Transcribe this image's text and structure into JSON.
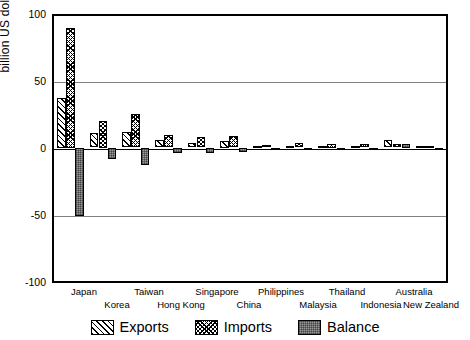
{
  "chart_data": {
    "type": "bar",
    "title": "",
    "subtitle": "",
    "xlabel": "",
    "ylabel": "billion US dollars",
    "ylim": [
      -100,
      100
    ],
    "yticks": [
      100,
      50,
      0,
      -50,
      -100
    ],
    "ytick_labels": [
      "100",
      "50",
      "0",
      "-50",
      "-100"
    ],
    "grid": true,
    "grid_axis": "y",
    "legend_position": "bottom-center",
    "categories": [
      "Japan",
      "Korea",
      "Taiwan",
      "Hong Kong",
      "Singapore",
      "China",
      "Philippines",
      "Malaysia",
      "Thailand",
      "Indonesia",
      "Australia",
      "New Zealand"
    ],
    "series": [
      {
        "name": "Exports",
        "pattern": "diagonal-hatch",
        "values": [
          37.5,
          11.0,
          12.0,
          5.5,
          3.5,
          5.0,
          1.5,
          1.5,
          1.5,
          1.5,
          6.0,
          1.0
        ]
      },
      {
        "name": "Imports",
        "pattern": "cross-hatch",
        "values": [
          90.0,
          20.0,
          25.5,
          9.5,
          8.0,
          9.0,
          2.0,
          3.5,
          2.5,
          3.0,
          3.0,
          1.0
        ]
      },
      {
        "name": "Balance",
        "pattern": "solid-gray",
        "values": [
          -52.0,
          -9.0,
          -13.5,
          -4.5,
          -4.0,
          -3.5,
          -1.0,
          -1.5,
          -0.8,
          -2.0,
          2.5,
          -0.3
        ]
      }
    ]
  },
  "axis": {
    "y_title": "billion US dollars",
    "ticks": [
      "100",
      "50",
      "0",
      "-50",
      "-100"
    ]
  },
  "x_labels": {
    "row_a": [
      "Japan",
      "Taiwan",
      "Singapore",
      "Philippines",
      "Thailand",
      "Australia"
    ],
    "row_b": [
      "Korea",
      "Hong Kong",
      "China",
      "Malaysia",
      "Indonesia",
      "New Zealand"
    ]
  },
  "legend": {
    "items": [
      {
        "label": "Exports",
        "swatch": "diagonal-hatch-swatch"
      },
      {
        "label": "Imports",
        "swatch": "cross-hatch-swatch"
      },
      {
        "label": "Balance",
        "swatch": "solid-gray-swatch"
      }
    ]
  }
}
